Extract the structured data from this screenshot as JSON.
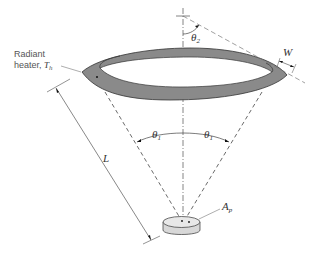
{
  "diagram": {
    "heater_label_line1": "Radiant",
    "heater_label_line2": "heater, ",
    "heater_symbol": "T",
    "heater_symbol_sub": "h",
    "length_symbol": "L",
    "width_symbol": "W",
    "angle1_symbol": "θ",
    "angle1_sub": "1",
    "angle2_symbol": "θ",
    "angle2_sub": "2",
    "area_symbol": "A",
    "area_sub": "p",
    "colors": {
      "ring_fill": "#8a8a8a",
      "ring_inner": "#9c9c9c",
      "lines": "#555555",
      "disk_fill": "#e6e6e6"
    }
  }
}
